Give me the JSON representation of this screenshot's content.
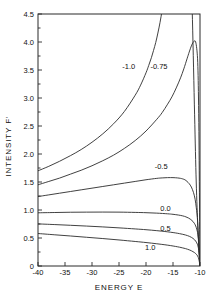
{
  "chart_data": {
    "type": "line",
    "title": "",
    "xlabel": "ENERGY E",
    "ylabel": "INTENSITY  F'",
    "xlim": [
      -40,
      -10
    ],
    "ylim": [
      0,
      4.5
    ],
    "xticks": [
      -40,
      -35,
      -30,
      -25,
      -20,
      -15,
      -10
    ],
    "xtick_labels": [
      "-40",
      "-35",
      "-30",
      "-25",
      "-20",
      "-15",
      "-10"
    ],
    "yticks": [
      0,
      0.5,
      1.0,
      1.5,
      2.0,
      2.5,
      3.0,
      3.5,
      4.0,
      4.5
    ],
    "ytick_labels": [
      "0",
      "0.5",
      "1.0",
      "1.5",
      "2.0",
      "2.5",
      "3.0",
      "3.5",
      "4.0",
      "4.5"
    ],
    "grid": false,
    "legend": "inline-curve-labels",
    "series": [
      {
        "name": "-1.0",
        "label": "-1.0",
        "label_x": -23.2,
        "label_y": 3.52,
        "x": [
          -40,
          -38,
          -36,
          -34,
          -32,
          -30,
          -28,
          -26,
          -24,
          -22,
          -21,
          -20,
          -19.5,
          -19,
          -18.6,
          -18.2,
          -17.8,
          -17.4,
          -17,
          -16.6,
          -16.2,
          -15.8,
          -15.4,
          -15,
          -14.6,
          -14.2,
          -13.8,
          -13.4,
          -13,
          -12.6,
          -12.2,
          -11.8,
          -11.4,
          -11,
          -10.7,
          -10.4,
          -10.2,
          -10.05,
          -10
        ],
        "y": [
          1.7,
          1.78,
          1.87,
          1.97,
          2.08,
          2.21,
          2.36,
          2.54,
          2.76,
          3.05,
          3.23,
          3.45,
          3.58,
          3.72,
          3.85,
          3.99,
          4.16,
          4.35,
          4.58,
          4.86,
          5.2,
          5.6,
          6.05,
          6.5,
          6.9,
          7.2,
          7.4,
          7.5,
          7.45,
          7.2,
          6.7,
          5.8,
          4.4,
          2.7,
          1.5,
          0.7,
          0.3,
          0.1,
          0.0
        ]
      },
      {
        "name": "-0.75",
        "label": "-0.75",
        "label_x": -17.6,
        "label_y": 3.52,
        "x": [
          -40,
          -38,
          -36,
          -34,
          -32,
          -30,
          -28,
          -26,
          -24,
          -22,
          -20,
          -18,
          -17,
          -16,
          -15.2,
          -14.4,
          -13.6,
          -13,
          -12.4,
          -12,
          -11.6,
          -11.3,
          -11.0,
          -10.8,
          -10.6,
          -10.45,
          -10.35,
          -10.28,
          -10.2,
          -10.14,
          -10.08,
          -10.04,
          -10
        ],
        "y": [
          1.45,
          1.51,
          1.57,
          1.64,
          1.71,
          1.79,
          1.88,
          1.98,
          2.1,
          2.24,
          2.41,
          2.62,
          2.74,
          2.89,
          3.02,
          3.18,
          3.36,
          3.52,
          3.7,
          3.82,
          3.93,
          3.99,
          4.02,
          4.0,
          3.88,
          3.7,
          3.4,
          3.0,
          2.4,
          1.7,
          0.95,
          0.4,
          0.0
        ]
      },
      {
        "name": "-0.5",
        "label": "-0.5",
        "label_x": -17.2,
        "label_y": 1.74,
        "x": [
          -40,
          -38,
          -36,
          -34,
          -32,
          -30,
          -28,
          -26,
          -24,
          -22,
          -20,
          -18,
          -17,
          -16,
          -15,
          -14.2,
          -13.6,
          -13.2,
          -12.8,
          -12.4,
          -12,
          -11.6,
          -11.2,
          -10.9,
          -10.7,
          -10.55,
          -10.45,
          -10.35,
          -10.25,
          -10.17,
          -10.1,
          -10.05,
          -10
        ],
        "y": [
          1.24,
          1.27,
          1.3,
          1.33,
          1.36,
          1.39,
          1.42,
          1.45,
          1.48,
          1.51,
          1.54,
          1.565,
          1.573,
          1.578,
          1.578,
          1.573,
          1.565,
          1.555,
          1.54,
          1.51,
          1.47,
          1.41,
          1.31,
          1.19,
          1.05,
          0.93,
          0.8,
          0.63,
          0.44,
          0.28,
          0.15,
          0.06,
          0.0
        ]
      },
      {
        "name": "0.0",
        "label": "0.0",
        "label_x": -16.4,
        "label_y": 0.98,
        "x": [
          -40,
          -37,
          -34,
          -31,
          -28,
          -25,
          -22,
          -20,
          -18,
          -16,
          -15,
          -14,
          -13.2,
          -12.6,
          -12.1,
          -11.7,
          -11.3,
          -11.0,
          -10.8,
          -10.6,
          -10.45,
          -10.35,
          -10.25,
          -10.17,
          -10.1,
          -10.05,
          -10
        ],
        "y": [
          0.95,
          0.955,
          0.96,
          0.962,
          0.963,
          0.962,
          0.957,
          0.952,
          0.944,
          0.932,
          0.923,
          0.91,
          0.895,
          0.877,
          0.855,
          0.83,
          0.795,
          0.755,
          0.715,
          0.66,
          0.6,
          0.535,
          0.445,
          0.335,
          0.215,
          0.11,
          0.0
        ]
      },
      {
        "name": "0.5",
        "label": "0.5",
        "label_x": -16.4,
        "label_y": 0.62,
        "x": [
          -40,
          -37,
          -34,
          -31,
          -28,
          -25,
          -22,
          -20,
          -18,
          -16.5,
          -15.5,
          -14.5,
          -13.8,
          -13.2,
          -12.7,
          -12.3,
          -11.9,
          -11.6,
          -11.3,
          -11.0,
          -10.8,
          -10.6,
          -10.45,
          -10.33,
          -10.23,
          -10.15,
          -10.08,
          -10.03,
          -10
        ],
        "y": [
          0.752,
          0.74,
          0.727,
          0.713,
          0.698,
          0.681,
          0.662,
          0.648,
          0.631,
          0.616,
          0.604,
          0.59,
          0.578,
          0.566,
          0.554,
          0.542,
          0.527,
          0.512,
          0.493,
          0.468,
          0.445,
          0.413,
          0.38,
          0.336,
          0.278,
          0.205,
          0.12,
          0.05,
          0.0
        ]
      },
      {
        "name": "1.0",
        "label": "1.0",
        "label_x": -19.2,
        "label_y": 0.28,
        "x": [
          -40,
          -37,
          -34,
          -31,
          -28,
          -25,
          -22,
          -20,
          -18,
          -16.5,
          -15.5,
          -14.5,
          -13.8,
          -13.2,
          -12.7,
          -12.3,
          -11.9,
          -11.6,
          -11.3,
          -11.0,
          -10.8,
          -10.6,
          -10.45,
          -10.33,
          -10.23,
          -10.15,
          -10.08,
          -10.03,
          -10
        ],
        "y": [
          0.58,
          0.558,
          0.536,
          0.513,
          0.49,
          0.465,
          0.438,
          0.419,
          0.397,
          0.379,
          0.365,
          0.349,
          0.336,
          0.323,
          0.311,
          0.299,
          0.285,
          0.272,
          0.256,
          0.238,
          0.222,
          0.201,
          0.181,
          0.156,
          0.125,
          0.09,
          0.05,
          0.02,
          0.0
        ]
      }
    ]
  }
}
